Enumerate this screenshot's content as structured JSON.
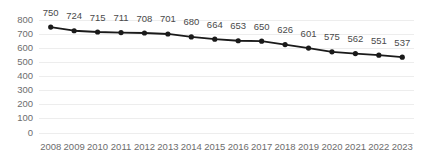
{
  "chart_data": {
    "type": "line",
    "title": "",
    "subtitle": "",
    "xlabel": "",
    "ylabel": "",
    "categories": [
      "2008",
      "2009",
      "2010",
      "2011",
      "2012",
      "2013",
      "2014",
      "2015",
      "2016",
      "2017",
      "2018",
      "2019",
      "2020",
      "2021",
      "2022",
      "2023"
    ],
    "values": [
      750,
      724,
      715,
      711,
      708,
      701,
      680,
      664,
      653,
      650,
      626,
      601,
      575,
      562,
      551,
      537
    ],
    "data_labels": [
      "750",
      "724",
      "715",
      "711",
      "708",
      "701",
      "680",
      "664",
      "653",
      "650",
      "626",
      "601",
      "575",
      "562",
      "551",
      "537"
    ],
    "ylim": [
      0,
      800
    ],
    "yticks": [
      800,
      700,
      600,
      500,
      400,
      300,
      200,
      100,
      0
    ],
    "ytick_labels": [
      "800",
      "700",
      "600",
      "500",
      "400",
      "300",
      "200",
      "100",
      "0"
    ],
    "grid": true,
    "grid_axis": "y",
    "legend": false,
    "legend_position": "none",
    "series": [
      {
        "name": "",
        "values": [
          750,
          724,
          715,
          711,
          708,
          701,
          680,
          664,
          653,
          650,
          626,
          601,
          575,
          562,
          551,
          537
        ]
      }
    ],
    "colors": {
      "line": "#1a1a1a",
      "marker": "#1a1a1a",
      "grid": "#ededed",
      "tick_text": "#6d6d6d",
      "data_label_text": "#4a4a4a",
      "background": "#ffffff"
    },
    "marker": "circle",
    "show_data_labels": true
  }
}
